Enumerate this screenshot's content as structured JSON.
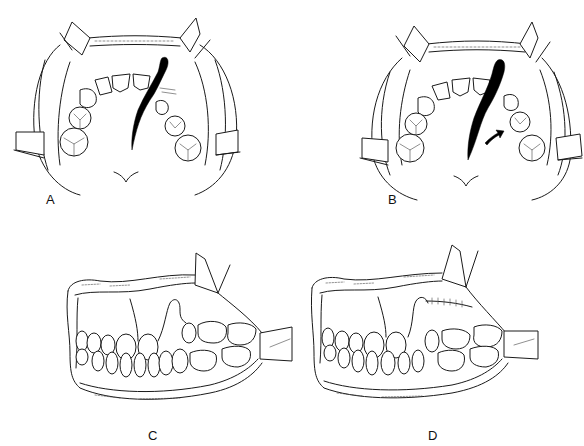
{
  "figure": {
    "panels": [
      {
        "id": "A",
        "label": "A",
        "view": "occlusal view of maxillary arch with retracted lips",
        "features": [
          "retractors",
          "alveolar cleft (black)",
          "incisors",
          "premolars",
          "molars"
        ]
      },
      {
        "id": "B",
        "label": "B",
        "view": "occlusal view of maxillary arch with widened cleft",
        "features": [
          "retractors",
          "widened alveolar cleft (black)",
          "curved arrow indicating segment movement",
          "incisors",
          "premolars",
          "molars"
        ]
      },
      {
        "id": "C",
        "label": "C",
        "view": "lateral view of dentition with gingival cleft",
        "features": [
          "lip retractors",
          "cleft gap in gingiva",
          "upper and lower teeth"
        ]
      },
      {
        "id": "D",
        "label": "D",
        "view": "lateral view after closure with sutures",
        "features": [
          "lip retractors",
          "sutured closure line",
          "upper and lower teeth"
        ]
      }
    ],
    "colors": {
      "ink": "#1a1a1a",
      "cleft_fill": "#000000",
      "background": "#ffffff"
    }
  }
}
